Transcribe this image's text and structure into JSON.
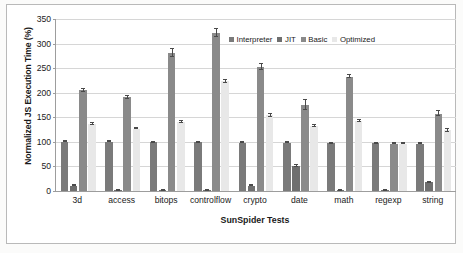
{
  "chart_data": {
    "type": "bar",
    "title": "",
    "xlabel": "SunSpider Tests",
    "ylabel": "Normalized JS Execution Time (%)",
    "ylim": [
      0,
      350
    ],
    "yticks": [
      0,
      50,
      100,
      150,
      200,
      250,
      300,
      350
    ],
    "grid": true,
    "legend_position": "top-center",
    "categories": [
      "3d",
      "access",
      "bitops",
      "controlflow",
      "crypto",
      "date",
      "math",
      "regexp",
      "string"
    ],
    "series": [
      {
        "name": "Interpreter",
        "color": "#7a7a7a",
        "values": [
          100,
          100,
          99,
          99,
          98,
          98,
          97,
          97,
          96
        ],
        "errors": [
          1,
          1,
          1,
          1,
          1,
          1,
          1,
          1,
          1
        ]
      },
      {
        "name": "JIT",
        "color": "#6f6f6f",
        "values": [
          11,
          1.5,
          1.5,
          1,
          11,
          50,
          1,
          0.5,
          18
        ],
        "errors": [
          1,
          0.5,
          0.5,
          0.5,
          1,
          2,
          0.5,
          0.5,
          1
        ]
      },
      {
        "name": "Basic",
        "color": "#8a8a8a",
        "values": [
          205,
          191,
          280,
          322,
          253,
          175,
          233,
          96,
          157
        ],
        "errors": [
          3,
          3,
          8,
          8,
          6,
          11,
          3,
          1,
          5
        ]
      },
      {
        "name": "Optimized",
        "color": "#e8e8e8",
        "values": [
          137,
          127,
          140,
          223,
          154,
          133,
          143,
          96,
          124
        ],
        "errors": [
          2,
          1,
          2,
          3,
          3,
          2,
          2,
          1,
          3
        ]
      }
    ]
  },
  "legend": {
    "entries": [
      {
        "label": "Interpreter"
      },
      {
        "label": "JIT"
      },
      {
        "label": "Basic"
      },
      {
        "label": "Optimized"
      }
    ]
  },
  "axes": {
    "y_title": "Normalized JS Execution Time (%)",
    "x_title": "SunSpider Tests"
  },
  "colors": {
    "interpreter": "#7a7a7a",
    "jit": "#6f6f6f",
    "basic": "#8a8a8a",
    "optimized": "#e8e8e8",
    "grid": "#d6d6d6",
    "axis": "#9d9d9d",
    "frame": "#b9b9b9",
    "text": "#1a1a1a",
    "background": "#ffffff"
  }
}
